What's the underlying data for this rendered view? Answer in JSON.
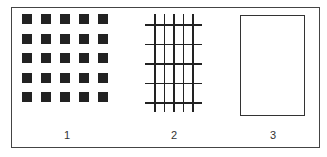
{
  "figure": {
    "panels": [
      {
        "id": "1",
        "label": "1",
        "description": "5x5 grid of filled black squares",
        "rows": 5,
        "cols": 5
      },
      {
        "id": "2",
        "label": "2",
        "description": "grid of 5 vertical and 5 horizontal crossing lines",
        "vertical_lines": 5,
        "horizontal_lines": 5
      },
      {
        "id": "3",
        "label": "3",
        "description": "empty outlined rectangle"
      }
    ],
    "colors": {
      "stroke": "#222222",
      "background": "#ffffff"
    }
  }
}
